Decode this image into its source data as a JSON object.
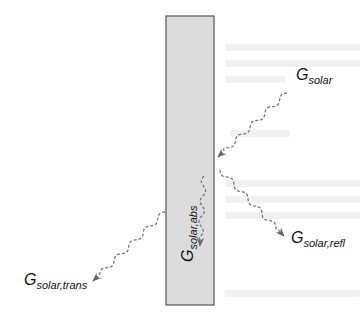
{
  "figure": {
    "slab": {
      "fill": "#dcdcdc",
      "stroke": "#555555",
      "x": 166,
      "y": 16,
      "width": 48,
      "height": 289
    },
    "arrow_color": "#666666",
    "labels": {
      "incident": {
        "main": "G",
        "sub": "solar"
      },
      "reflected": {
        "main": "G",
        "sub": "solar,refl"
      },
      "absorbed": {
        "main": "G",
        "sub": "solar,abs"
      },
      "transmitted": {
        "main": "G",
        "sub": "solar,trans"
      }
    },
    "arrows": [
      {
        "name": "incident",
        "from": [
          287,
          93
        ],
        "to": [
          218,
          157
        ]
      },
      {
        "name": "reflected",
        "from": [
          220,
          170
        ],
        "to": [
          284,
          236
        ]
      },
      {
        "name": "absorbed",
        "from": [
          204,
          176
        ],
        "to": [
          200,
          246
        ]
      },
      {
        "name": "transmitted",
        "from": [
          165,
          212
        ],
        "to": [
          93,
          281
        ]
      }
    ]
  }
}
